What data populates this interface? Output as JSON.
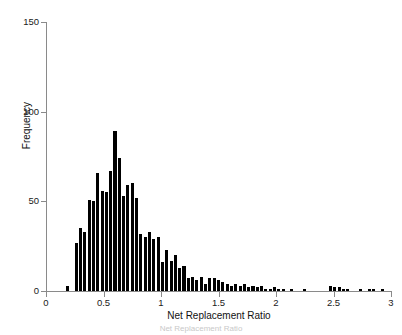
{
  "figure": {
    "background_color": "#ffffff",
    "axis_color": "#8a8a8a",
    "bar_color": "#000000",
    "caption": "Net Replacement Ratio"
  },
  "chart_data": {
    "type": "bar",
    "title": "",
    "subtitle": "",
    "xlabel": "Net Replacement Ratio",
    "ylabel": "Frequency",
    "xlim": [
      0,
      3
    ],
    "ylim": [
      0,
      150
    ],
    "xticks": [
      0,
      0.5,
      1,
      1.5,
      2,
      2.5,
      3
    ],
    "xtick_labels": [
      "0",
      "0.5",
      "1",
      "1.5",
      "2",
      "2.5",
      "3"
    ],
    "yticks": [
      0,
      50,
      100,
      150
    ],
    "ytick_labels": [
      "0",
      "50",
      "100",
      "150"
    ],
    "grid": false,
    "legend": null,
    "bin_width": 0.0375,
    "bar_color": "#000000",
    "categories": [
      0.1875,
      0.225,
      0.2625,
      0.3,
      0.3375,
      0.375,
      0.4125,
      0.45,
      0.4875,
      0.525,
      0.5625,
      0.6,
      0.6375,
      0.675,
      0.7125,
      0.75,
      0.7875,
      0.825,
      0.8625,
      0.9,
      0.9375,
      0.975,
      1.0125,
      1.05,
      1.0875,
      1.125,
      1.1625,
      1.2,
      1.2375,
      1.275,
      1.3125,
      1.35,
      1.3875,
      1.425,
      1.4625,
      1.5,
      1.5375,
      1.575,
      1.6125,
      1.65,
      1.6875,
      1.725,
      1.7625,
      1.8,
      1.8375,
      1.875,
      1.9125,
      1.95,
      1.9875,
      2.025,
      2.0625,
      2.1,
      2.1375,
      2.175,
      2.2125,
      2.25,
      2.2875,
      2.325,
      2.3625,
      2.4,
      2.4375,
      2.475,
      2.5125,
      2.55,
      2.5875,
      2.625,
      2.6625,
      2.7,
      2.7375,
      2.775,
      2.8125,
      2.85,
      2.8875,
      2.925
    ],
    "values": [
      3,
      0,
      27,
      35,
      33,
      51,
      50,
      66,
      56,
      55,
      67,
      89,
      74,
      53,
      59,
      60,
      52,
      32,
      30,
      33,
      29,
      30,
      16,
      23,
      17,
      20,
      13,
      14,
      7,
      8,
      6,
      8,
      4,
      7,
      7,
      6,
      5,
      4,
      3,
      4,
      3,
      4,
      2,
      3,
      2,
      3,
      1,
      1,
      2,
      1,
      1,
      0,
      1,
      0,
      0,
      1,
      0,
      0,
      0,
      0,
      0,
      3,
      2,
      2,
      1,
      1,
      0,
      0,
      1,
      0,
      1,
      1,
      0,
      1
    ],
    "annotations": []
  }
}
